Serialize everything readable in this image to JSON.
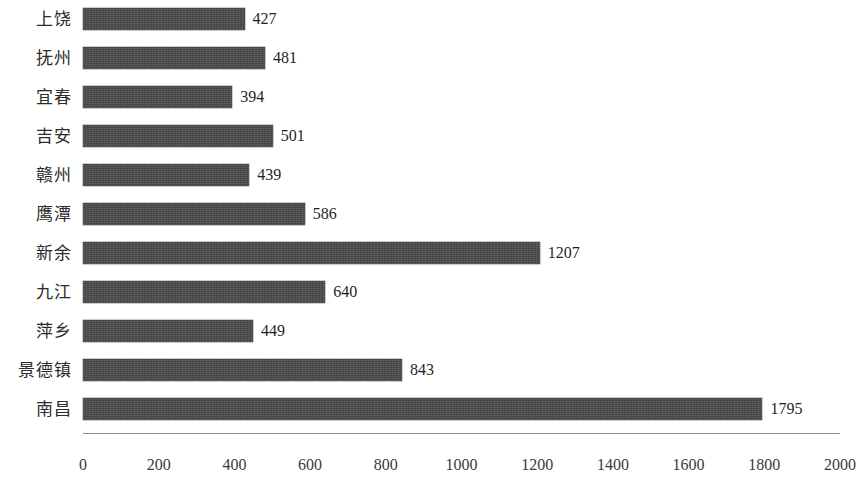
{
  "chart_data": {
    "type": "bar",
    "orientation": "horizontal",
    "title": "",
    "subtitle": "",
    "xlabel": "",
    "ylabel": "",
    "categories": [
      "上饶",
      "抚州",
      "宜春",
      "吉安",
      "赣州",
      "鹰潭",
      "新余",
      "九江",
      "萍乡",
      "景德镇",
      "南昌"
    ],
    "values": [
      427,
      481,
      394,
      501,
      439,
      586,
      1207,
      640,
      449,
      843,
      1795
    ],
    "data_labels": [
      "427",
      "481",
      "394",
      "501",
      "439",
      "586",
      "1207",
      "640",
      "449",
      "843",
      "1795"
    ],
    "xlim": [
      0,
      2000
    ],
    "xticks": [
      0,
      200,
      400,
      600,
      800,
      1000,
      1200,
      1400,
      1600,
      1800,
      2000
    ],
    "xtick_labels": [
      "0",
      "200",
      "400",
      "600",
      "800",
      "1000",
      "1200",
      "1400",
      "1600",
      "1800",
      "2000"
    ],
    "grid": false,
    "legend": null,
    "legend_position": "none",
    "bar_color": "#4b4b4b",
    "axis_color": "#8d8d8d",
    "text_color": "#2b2b2b",
    "background": "#ffffff",
    "series": [
      {
        "name": "",
        "values": [
          427,
          481,
          394,
          501,
          439,
          586,
          1207,
          640,
          449,
          843,
          1795
        ]
      }
    ]
  }
}
